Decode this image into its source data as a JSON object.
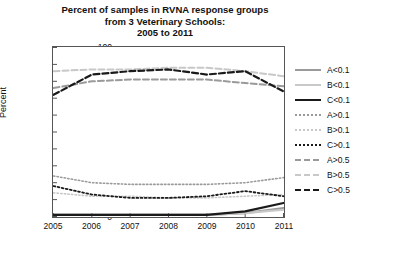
{
  "chart_data": {
    "type": "line",
    "title": "Percent of samples in RVNA response groups from 3 Veterinary Schools: 2005 to 2011",
    "title_lines": [
      "Percent of samples in RVNA response groups",
      "from 3 Veterinary Schools:",
      "2005 to 2011"
    ],
    "xlabel": "",
    "ylabel": "Percent",
    "categories": [
      "2005",
      "2006",
      "2007",
      "2008",
      "2009",
      "2010",
      "2011"
    ],
    "x": [
      2005,
      2006,
      2007,
      2008,
      2009,
      2010,
      2011
    ],
    "xlim": [
      2005,
      2011
    ],
    "ylim": [
      0,
      100
    ],
    "yticks": [
      0,
      10,
      20,
      30,
      40,
      50,
      60,
      70,
      80,
      90,
      100
    ],
    "grid": false,
    "legend_position": "right",
    "series": [
      {
        "name": "A<0.1",
        "style": "solid",
        "color": "#9a9a9a",
        "width": 2.2,
        "values": [
          1,
          1,
          1,
          1,
          1,
          2,
          5
        ]
      },
      {
        "name": "B<0.1",
        "style": "solid",
        "color": "#c8c8c8",
        "width": 2.2,
        "values": [
          1,
          1,
          1,
          1,
          1,
          2,
          4
        ]
      },
      {
        "name": "C<0.1",
        "style": "solid",
        "color": "#1a1a1a",
        "width": 2.2,
        "values": [
          1,
          1,
          1,
          1,
          1,
          3,
          8
        ]
      },
      {
        "name": "A>0.1",
        "style": "dotted",
        "color": "#9a9a9a",
        "width": 1.6,
        "values": [
          24,
          20,
          19,
          19,
          19,
          20,
          23
        ]
      },
      {
        "name": "B>0.1",
        "style": "dotted",
        "color": "#c8c8c8",
        "width": 1.6,
        "values": [
          14,
          12,
          12,
          11,
          11,
          12,
          13
        ]
      },
      {
        "name": "C>0.1",
        "style": "dotted",
        "color": "#1a1a1a",
        "width": 1.8,
        "values": [
          18,
          13,
          11,
          11,
          12,
          15,
          12
        ]
      },
      {
        "name": "A>0.5",
        "style": "dashed",
        "color": "#9a9a9a",
        "width": 2.0,
        "values": [
          76,
          80,
          81,
          81,
          81,
          79,
          77
        ]
      },
      {
        "name": "B>0.5",
        "style": "dashed",
        "color": "#c8c8c8",
        "width": 2.0,
        "values": [
          86,
          87,
          87,
          88,
          88,
          86,
          83
        ]
      },
      {
        "name": "C>0.5",
        "style": "dashed",
        "color": "#1a1a1a",
        "width": 2.2,
        "values": [
          72,
          84,
          86,
          87,
          84,
          86,
          74
        ]
      }
    ]
  },
  "legend": {
    "items": [
      {
        "label": "A<0.1"
      },
      {
        "label": "B<0.1"
      },
      {
        "label": "C<0.1"
      },
      {
        "label": "A>0.1"
      },
      {
        "label": "B>0.1"
      },
      {
        "label": "C>0.1"
      },
      {
        "label": "A>0.5"
      },
      {
        "label": "B>0.5"
      },
      {
        "label": "C>0.5"
      }
    ]
  }
}
